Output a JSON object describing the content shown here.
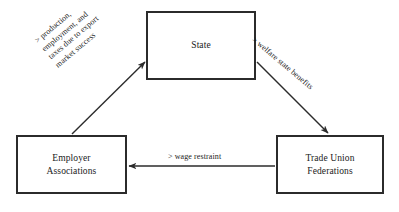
{
  "diagram": {
    "background_color": "#ffffff",
    "stroke_color": "#2b2b2b",
    "text_color": "#1a1a1a",
    "nodes": [
      {
        "id": "state",
        "label": "State"
      },
      {
        "id": "employer",
        "label": "Employer\nAssociations"
      },
      {
        "id": "union",
        "label": "Trade Union\nFederations"
      }
    ],
    "edges": [
      {
        "id": "employer-to-state",
        "from": "Employer Associations",
        "to": "State",
        "label": "> production,\nemployment, and\ntaxes due to export\nmarket success",
        "direction": "up-right"
      },
      {
        "id": "state-to-union",
        "from": "State",
        "to": "Trade Union Federations",
        "label": "> welfare state benefits",
        "direction": "down-right"
      },
      {
        "id": "union-to-employer",
        "from": "Trade Union Federations",
        "to": "Employer Associations",
        "label": ">  wage  restraint",
        "direction": "left"
      }
    ]
  }
}
